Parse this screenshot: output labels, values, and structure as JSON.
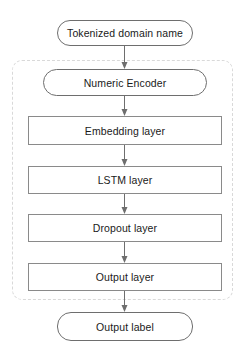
{
  "diagram": {
    "type": "flowchart",
    "direction": "top-to-bottom",
    "colors": {
      "stroke": "#6e6e6e",
      "arrow": "#6e6e6e",
      "text": "#1a1a1a",
      "container_dashed": "#d9d9d9",
      "background": "#ffffff"
    },
    "nodes": [
      {
        "id": "input",
        "label": "Tokenized domain name",
        "shape": "rounded"
      },
      {
        "id": "encoder",
        "label": "Numeric Encoder",
        "shape": "rounded"
      },
      {
        "id": "embedding",
        "label": "Embedding layer",
        "shape": "rectangle"
      },
      {
        "id": "lstm",
        "label": "LSTM layer",
        "shape": "rectangle"
      },
      {
        "id": "dropout",
        "label": "Dropout layer",
        "shape": "rectangle"
      },
      {
        "id": "output_layer",
        "label": "Output layer",
        "shape": "rectangle"
      },
      {
        "id": "output",
        "label": "Output label",
        "shape": "rounded"
      }
    ],
    "edges": [
      {
        "from": "input",
        "to": "encoder"
      },
      {
        "from": "encoder",
        "to": "embedding"
      },
      {
        "from": "embedding",
        "to": "lstm"
      },
      {
        "from": "lstm",
        "to": "dropout"
      },
      {
        "from": "dropout",
        "to": "output_layer"
      },
      {
        "from": "output_layer",
        "to": "output"
      }
    ],
    "group": {
      "style": "dashed-rounded",
      "contains": [
        "encoder",
        "embedding",
        "lstm",
        "dropout",
        "output_layer"
      ]
    }
  }
}
